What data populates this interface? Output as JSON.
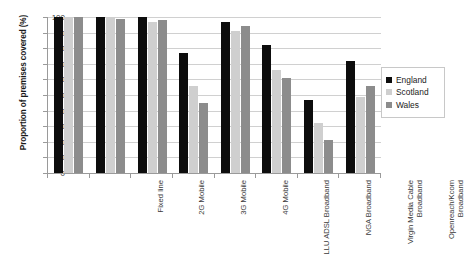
{
  "chart_data": {
    "type": "bar",
    "title": "",
    "xlabel": "",
    "ylabel": "Proportion of premises covered (%)",
    "ylim": [
      0,
      100
    ],
    "ytick_step": 10,
    "yticks": [
      0,
      10,
      20,
      30,
      40,
      50,
      60,
      70,
      80,
      90,
      100
    ],
    "grid": true,
    "legend_position": "right",
    "categories": [
      "Fixed line",
      "2G Mobile",
      "3G Mobile",
      "4G Mobile",
      "LLU ADSL Broadband",
      "NGA Broadband",
      "Virgin Media Cable Broadband",
      "Openreach/Kcom Broadband"
    ],
    "series": [
      {
        "name": "England",
        "color": "#0d0d0d",
        "values": [
          100,
          100,
          100,
          77,
          97,
          82,
          47,
          72
        ]
      },
      {
        "name": "Scotland",
        "color": "#cfcfcf",
        "values": [
          100,
          100,
          97,
          56,
          91,
          66,
          32,
          49
        ]
      },
      {
        "name": "Wales",
        "color": "#8c8c8c",
        "values": [
          100,
          99,
          98,
          45,
          94,
          61,
          21,
          56
        ]
      }
    ]
  },
  "axis": {
    "y_title": "Proportion of premises covered (%)",
    "y_tick_labels": [
      "100",
      "90",
      "80",
      "70",
      "60",
      "50",
      "40",
      "30",
      "20",
      "10",
      "0"
    ]
  },
  "legend": {
    "items": [
      {
        "label": "England",
        "color": "#0d0d0d"
      },
      {
        "label": "Scotland",
        "color": "#cfcfcf"
      },
      {
        "label": "Wales",
        "color": "#8c8c8c"
      }
    ]
  }
}
